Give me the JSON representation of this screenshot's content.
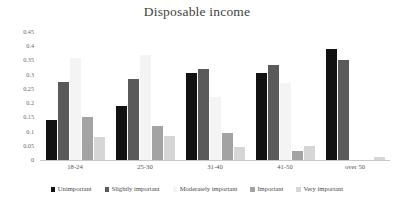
{
  "chart_data": {
    "type": "bar",
    "title": "Disposable income",
    "xlabel": "",
    "ylabel": "",
    "ylim": [
      0,
      0.45
    ],
    "yticks": [
      "0.45",
      "0.4",
      "0.35",
      "0.3",
      "0.25",
      "0.2",
      "0.15",
      "0.1",
      "0.05",
      "0"
    ],
    "ytick_values": [
      0.45,
      0.4,
      0.35,
      0.3,
      0.25,
      0.2,
      0.15,
      0.1,
      0.05,
      0
    ],
    "grid": false,
    "legend_position": "bottom",
    "categories": [
      "18-24",
      "25-30",
      "31-40",
      "41-50",
      "over 50"
    ],
    "series": [
      {
        "name": "Unimportant",
        "color": "#121212",
        "values": [
          0.14,
          0.19,
          0.305,
          0.305,
          0.39
        ]
      },
      {
        "name": "Slightly important",
        "color": "#5a5a5a",
        "values": [
          0.275,
          0.285,
          0.32,
          0.335,
          0.35
        ]
      },
      {
        "name": "Moderately important",
        "color": "#f4f4f4",
        "values": [
          0.36,
          0.37,
          0.22,
          0.27,
          0.0
        ]
      },
      {
        "name": "Important",
        "color": "#a3a3a3",
        "values": [
          0.15,
          0.12,
          0.095,
          0.03,
          0.0
        ]
      },
      {
        "name": "Very important",
        "color": "#d6d6d6",
        "values": [
          0.08,
          0.085,
          0.045,
          0.05,
          0.01
        ]
      }
    ]
  }
}
